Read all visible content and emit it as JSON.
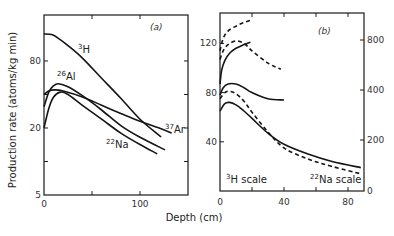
{
  "figure": {
    "xlabel": "Depth (cm)",
    "ylabel": "Production rate (atoms/kg min)"
  },
  "chart_data": [
    {
      "type": "line",
      "panel_label": "(a)",
      "xlabel": "Depth (cm)",
      "ylabel": "Production rate (atoms/kg min)",
      "xlim": [
        0,
        150
      ],
      "ylim": [
        5,
        160
      ],
      "yscale": "log",
      "xticks": [
        "0",
        "100"
      ],
      "yticks": [
        "5",
        "20",
        "80"
      ],
      "grid": false,
      "series": [
        {
          "name": "3H",
          "label_mass": "3",
          "label_el": "H",
          "style": "solid",
          "x": [
            0,
            8,
            15,
            25,
            40,
            60,
            80,
            100,
            122
          ],
          "y": [
            140,
            138,
            128,
            110,
            85,
            56,
            37,
            24,
            16.6
          ]
        },
        {
          "name": "26Al",
          "label_mass": "26",
          "label_el": "Al",
          "style": "solid",
          "x": [
            0,
            5,
            10,
            15,
            25,
            40,
            60,
            80,
            100,
            126
          ],
          "y": [
            31,
            42,
            48,
            50,
            47,
            39,
            29,
            21,
            16.5,
            12.7
          ]
        },
        {
          "name": "37Ar",
          "label_mass": "37",
          "label_el": "Ar",
          "style": "solid",
          "x": [
            0,
            5,
            11,
            20,
            40,
            60,
            80,
            100,
            120,
            133
          ],
          "y": [
            40,
            43,
            44,
            43,
            38,
            32,
            27,
            23,
            20,
            18
          ]
        },
        {
          "name": "22Na",
          "label_mass": "22",
          "label_el": "Na",
          "style": "solid",
          "x": [
            0,
            5,
            10,
            17,
            25,
            40,
            60,
            80,
            100,
            118
          ],
          "y": [
            20,
            30,
            38,
            42,
            40,
            32,
            24,
            18,
            14.2,
            11.7
          ]
        }
      ]
    },
    {
      "type": "line",
      "panel_label": "(b)",
      "xlabel": "Depth (cm)",
      "xlim": [
        0,
        90
      ],
      "ylim_left": [
        0,
        140
      ],
      "ylim_right": [
        0,
        900
      ],
      "yscale_right": "nonlinear",
      "xticks": [
        "0",
        "40",
        "80"
      ],
      "yticks_left": [
        "40",
        "80",
        "120"
      ],
      "yticks_right": [
        "0",
        "200",
        "400",
        "800"
      ],
      "annotations": [
        {
          "mass": "3",
          "el": "H",
          "text": " scale"
        },
        {
          "mass": "22",
          "el": "Na",
          "text": " scale"
        }
      ],
      "grid": false,
      "series": [
        {
          "name": "3H upper dashed",
          "style": "dashed",
          "x": [
            0,
            2,
            5,
            10,
            15,
            20
          ],
          "y": [
            114,
            124,
            130,
            134,
            137,
            139
          ]
        },
        {
          "name": "3H dashed",
          "style": "dashed",
          "x": [
            0,
            2,
            5,
            10,
            15,
            20,
            30,
            38
          ],
          "y": [
            107,
            114,
            119,
            122,
            120,
            114,
            104,
            99
          ]
        },
        {
          "name": "3H solid",
          "style": "solid",
          "x": [
            0,
            1,
            3,
            6,
            10,
            15,
            19
          ],
          "y": [
            87,
            98,
            106,
            112,
            116,
            119,
            121
          ]
        },
        {
          "name": "22Na solid upper",
          "style": "solid",
          "x": [
            0,
            2,
            5,
            10,
            15,
            20,
            30,
            40
          ],
          "y": [
            78,
            84,
            87,
            87,
            84,
            80,
            75,
            74
          ]
        },
        {
          "name": "22Na dashed",
          "style": "dashed",
          "x": [
            0,
            3,
            6,
            10,
            15,
            20,
            30,
            40,
            55,
            70,
            88
          ],
          "y": [
            75,
            80,
            81,
            79,
            73,
            64,
            48,
            35,
            26,
            20,
            14
          ]
        },
        {
          "name": "22Na solid lower",
          "style": "solid",
          "x": [
            0,
            3,
            6,
            10,
            15,
            20,
            30,
            40,
            55,
            70,
            88
          ],
          "y": [
            65,
            71,
            72,
            70,
            65,
            59,
            47,
            38,
            30,
            24,
            19
          ]
        }
      ]
    }
  ]
}
